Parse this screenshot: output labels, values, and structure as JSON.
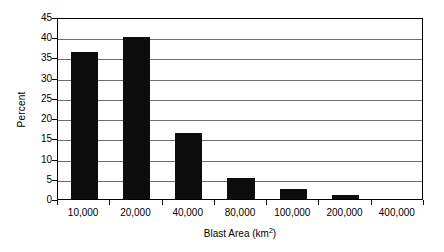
{
  "chart_data": {
    "type": "bar",
    "title": "",
    "xlabel": "Blast Area (km2)",
    "xlabel_base": "Blast Area (km",
    "xlabel_sup": "2",
    "xlabel_close": ")",
    "ylabel": "Percent",
    "categories": [
      "10,000",
      "20,000",
      "40,000",
      "80,000",
      "100,000",
      "200,000",
      "400,000"
    ],
    "values": [
      36.3,
      40.0,
      16.4,
      5.2,
      2.4,
      1.0,
      0.0
    ],
    "ylim": [
      0,
      45
    ],
    "ytick_labels": [
      "0",
      "5",
      "10",
      "15",
      "20",
      "25",
      "30",
      "35",
      "40",
      "45"
    ],
    "ytick_values": [
      0,
      5,
      10,
      15,
      20,
      25,
      30,
      35,
      40,
      45
    ],
    "grid": true,
    "grid_axis": "y",
    "legend": false,
    "legend_position": "none",
    "bar_color": "#0d0d0d",
    "grid_color": "#6d6d6d",
    "frame_color": "#000000",
    "background": "#ffffff"
  }
}
